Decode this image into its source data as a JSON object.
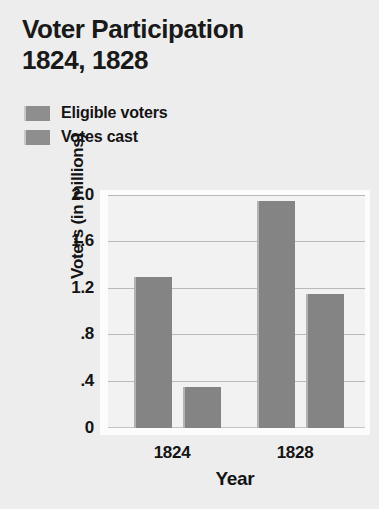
{
  "title": {
    "line1": "Voter Participation",
    "line2": "1824, 1828"
  },
  "legend": [
    {
      "label": "Eligible voters",
      "swatch_color": "#8e8e8e",
      "icon": "square-swatch-icon"
    },
    {
      "label": "Votes cast",
      "swatch_color": "#8e8e8e",
      "icon": "square-swatch-icon"
    }
  ],
  "axes": {
    "y_title": "Voters (in millions)",
    "x_title": "Year",
    "y_ticks": [
      "2.0",
      "1.6",
      "1.2",
      ".8",
      ".4",
      "0"
    ],
    "x_ticks": [
      "1824",
      "1828"
    ]
  },
  "colors": {
    "page_background": "#ededee",
    "plot_background": "#f2f2f2",
    "plot_frame": "#fcfcfc",
    "bar_fill": "#848484",
    "bar_highlight": "#b3b3b3",
    "gridline": "#b9b9b9",
    "text": "#141414"
  },
  "chart_data": {
    "type": "bar",
    "title": "Voter Participation 1824, 1828",
    "xlabel": "Year",
    "ylabel": "Voters (in millions)",
    "categories": [
      "1824",
      "1828"
    ],
    "series": [
      {
        "name": "Eligible voters",
        "values": [
          1.3,
          1.95
        ]
      },
      {
        "name": "Votes cast",
        "values": [
          0.35,
          1.15
        ]
      }
    ],
    "ylim": [
      0,
      2.0
    ],
    "yticks": [
      0,
      0.4,
      0.8,
      1.2,
      1.6,
      2.0
    ],
    "ytick_labels": [
      "0",
      ".4",
      ".8",
      "1.2",
      "1.6",
      "2.0"
    ],
    "grid": true,
    "grid_axis": "y",
    "legend_position": "above-plot-left",
    "bars": [
      {
        "category": "1824",
        "series": "Eligible voters",
        "value": 1.3
      },
      {
        "category": "1824",
        "series": "Votes cast",
        "value": 0.35
      },
      {
        "category": "1828",
        "series": "Eligible voters",
        "value": 1.95
      },
      {
        "category": "1828",
        "series": "Votes cast",
        "value": 1.15
      }
    ]
  }
}
